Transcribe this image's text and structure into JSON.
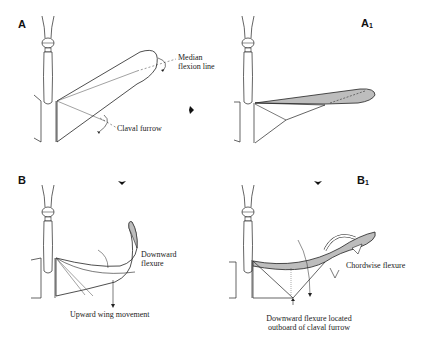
{
  "figure": {
    "panels": [
      {
        "id": "A",
        "label": "A",
        "sub": ""
      },
      {
        "id": "A1",
        "label": "A",
        "sub": "1"
      },
      {
        "id": "B",
        "label": "B",
        "sub": ""
      },
      {
        "id": "B1",
        "label": "B",
        "sub": "1"
      }
    ],
    "annotations": {
      "median_flexion_line_1": "Median",
      "median_flexion_line_2": "flexion line",
      "claval_furrow": "Claval furrow",
      "downward_flexure_1": "Downward",
      "downward_flexure_2": "flexure",
      "upward_wing_movement": "Upward wing movement",
      "chordwise_flexure": "Chordwise flexure",
      "downward_flexure_outboard_1": "Downward flexure located",
      "downward_flexure_outboard_2": "outboard of claval furrow"
    },
    "colors": {
      "line": "#222222",
      "wing_fill": "#bdbdbd",
      "wing_fill_dark": "#9a9a9a",
      "background": "#ffffff"
    }
  }
}
